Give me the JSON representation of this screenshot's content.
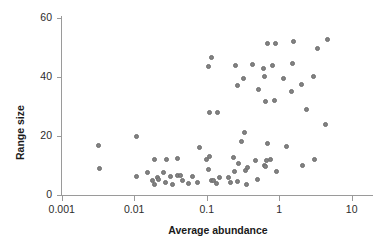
{
  "chart_data": {
    "type": "scatter",
    "title": "",
    "xlabel": "Average abundance",
    "ylabel": "Range size",
    "xscale": "log",
    "yscale": "linear",
    "xlim": [
      0.001,
      15
    ],
    "ylim": [
      0,
      60
    ],
    "xticks": [
      0.001,
      0.01,
      0.1,
      1,
      10
    ],
    "xtick_labels": [
      "0.001",
      "0.01",
      "0.1",
      "1",
      "10"
    ],
    "yticks": [
      0,
      20,
      40,
      60
    ],
    "ytick_labels": [
      "0",
      "20",
      "40",
      "60"
    ],
    "grid": false,
    "legend": null,
    "marker_color": "#828282",
    "axis_color": "#9a9a9a",
    "n_points": 78,
    "points": [
      {
        "x": 0.0032,
        "y": 16.9
      },
      {
        "x": 0.0033,
        "y": 9.0
      },
      {
        "x": 0.0108,
        "y": 19.8
      },
      {
        "x": 0.0108,
        "y": 6.2
      },
      {
        "x": 0.0152,
        "y": 7.5
      },
      {
        "x": 0.019,
        "y": 12.2
      },
      {
        "x": 0.0193,
        "y": 3.5
      },
      {
        "x": 0.0209,
        "y": 5.8
      },
      {
        "x": 0.0215,
        "y": 5.1
      },
      {
        "x": 0.025,
        "y": 7.5
      },
      {
        "x": 0.0282,
        "y": 11.9
      },
      {
        "x": 0.032,
        "y": 6.3
      },
      {
        "x": 0.0333,
        "y": 3.5
      },
      {
        "x": 0.0395,
        "y": 12.3
      },
      {
        "x": 0.04,
        "y": 6.6
      },
      {
        "x": 0.043,
        "y": 6.5
      },
      {
        "x": 0.056,
        "y": 3.8
      },
      {
        "x": 0.063,
        "y": 6.2
      },
      {
        "x": 0.08,
        "y": 16.2
      },
      {
        "x": 0.105,
        "y": 8.8
      },
      {
        "x": 0.107,
        "y": 43.5
      },
      {
        "x": 0.108,
        "y": 28.0
      },
      {
        "x": 0.11,
        "y": 13.0
      },
      {
        "x": 0.115,
        "y": 46.6
      },
      {
        "x": 0.118,
        "y": 4.8
      },
      {
        "x": 0.143,
        "y": 28.1
      },
      {
        "x": 0.148,
        "y": 6.1
      },
      {
        "x": 0.235,
        "y": 12.7
      },
      {
        "x": 0.238,
        "y": 7.8
      },
      {
        "x": 0.25,
        "y": 43.9
      },
      {
        "x": 0.262,
        "y": 37.2
      },
      {
        "x": 0.275,
        "y": 10.6
      },
      {
        "x": 0.305,
        "y": 18.2
      },
      {
        "x": 0.32,
        "y": 39.5
      },
      {
        "x": 0.335,
        "y": 21.3
      },
      {
        "x": 0.34,
        "y": 8.4
      },
      {
        "x": 0.355,
        "y": 3.7
      },
      {
        "x": 0.43,
        "y": 44.2
      },
      {
        "x": 0.465,
        "y": 11.6
      },
      {
        "x": 0.52,
        "y": 35.6
      },
      {
        "x": 0.61,
        "y": 43.0
      },
      {
        "x": 0.62,
        "y": 40.1
      },
      {
        "x": 0.63,
        "y": 10.0
      },
      {
        "x": 0.64,
        "y": 31.8
      },
      {
        "x": 0.65,
        "y": 9.7
      },
      {
        "x": 0.66,
        "y": 11.8
      },
      {
        "x": 0.68,
        "y": 51.2
      },
      {
        "x": 0.69,
        "y": 17.3
      },
      {
        "x": 0.75,
        "y": 12.0
      },
      {
        "x": 0.82,
        "y": 44.0
      },
      {
        "x": 0.86,
        "y": 31.9
      },
      {
        "x": 0.9,
        "y": 51.4
      },
      {
        "x": 0.92,
        "y": 7.8
      },
      {
        "x": 1.15,
        "y": 39.6
      },
      {
        "x": 1.25,
        "y": 16.4
      },
      {
        "x": 1.48,
        "y": 35.0
      },
      {
        "x": 1.55,
        "y": 44.5
      },
      {
        "x": 1.6,
        "y": 52.0
      },
      {
        "x": 2.05,
        "y": 37.5
      },
      {
        "x": 2.1,
        "y": 9.9
      },
      {
        "x": 2.4,
        "y": 29.0
      },
      {
        "x": 3.0,
        "y": 40.1
      },
      {
        "x": 3.1,
        "y": 12.2
      },
      {
        "x": 3.4,
        "y": 49.5
      },
      {
        "x": 4.4,
        "y": 24.0
      },
      {
        "x": 4.6,
        "y": 52.6
      },
      {
        "x": 0.099,
        "y": 12.2
      },
      {
        "x": 0.125,
        "y": 5.0
      },
      {
        "x": 0.2,
        "y": 6.0
      },
      {
        "x": 0.21,
        "y": 4.2
      },
      {
        "x": 0.046,
        "y": 5.0
      },
      {
        "x": 0.027,
        "y": 4.4
      },
      {
        "x": 0.27,
        "y": 4.5
      },
      {
        "x": 0.5,
        "y": 5.4
      },
      {
        "x": 0.135,
        "y": 4.0
      },
      {
        "x": 0.075,
        "y": 4.1
      },
      {
        "x": 0.018,
        "y": 4.8
      },
      {
        "x": 0.36,
        "y": 9.3
      }
    ]
  },
  "axes": {
    "y_title": "Range size",
    "x_title": "Average abundance"
  }
}
